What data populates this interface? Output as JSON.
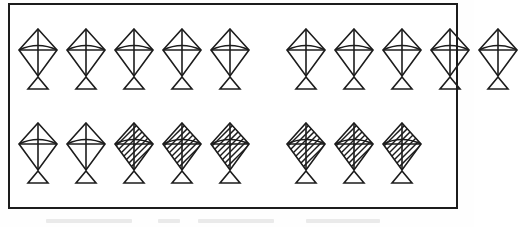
{
  "figure": {
    "type": "pictograph-counting-worksheet",
    "border_color": "#1c1c1c",
    "ink_color": "#1c1c1c",
    "background_color": "#ffffff",
    "total_kites": 18,
    "rows": [
      {
        "row_index": 1,
        "count": 10,
        "groups": [
          {
            "group_index": 1,
            "count": 5,
            "kites": [
              "plain",
              "plain",
              "plain",
              "plain",
              "plain"
            ]
          },
          {
            "group_index": 2,
            "count": 5,
            "kites": [
              "plain",
              "plain",
              "plain",
              "plain",
              "plain"
            ]
          }
        ]
      },
      {
        "row_index": 2,
        "count": 8,
        "groups": [
          {
            "group_index": 1,
            "count": 5,
            "kites": [
              "plain",
              "plain",
              "hatched",
              "hatched",
              "hatched"
            ]
          },
          {
            "group_index": 2,
            "count": 3,
            "kites": [
              "hatched",
              "hatched",
              "hatched"
            ]
          }
        ]
      }
    ],
    "legend": {
      "plain_label": "plain kite",
      "hatched_label": "shaded kite"
    },
    "counts": {
      "plain_total": 12,
      "hatched_total": 6
    }
  }
}
